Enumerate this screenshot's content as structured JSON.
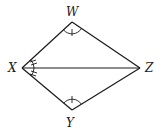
{
  "diagram": {
    "type": "kite-geometry",
    "vertices": {
      "W": {
        "label": "W",
        "x": 72,
        "y": 22
      },
      "X": {
        "label": "X",
        "x": 22,
        "y": 68
      },
      "Y": {
        "label": "Y",
        "x": 72,
        "y": 110
      },
      "Z": {
        "label": "Z",
        "x": 140,
        "y": 68
      }
    },
    "segments": [
      "XW",
      "WZ",
      "XY",
      "YZ",
      "XZ"
    ],
    "angle_marks": [
      {
        "vertex": "W",
        "style": "single arc with tick"
      },
      {
        "vertex": "Y",
        "style": "single arc with tick"
      },
      {
        "vertex": "X",
        "part": "WXZ",
        "style": "arc with double tick"
      },
      {
        "vertex": "X",
        "part": "ZXY",
        "style": "arc with double tick"
      }
    ],
    "colors": {
      "stroke": "#1a1a1a",
      "background": "#ffffff"
    }
  }
}
